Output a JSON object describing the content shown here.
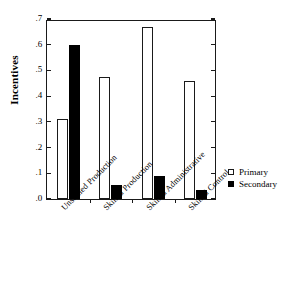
{
  "chart_data": {
    "type": "bar",
    "title": "",
    "xlabel": "",
    "ylabel": "Incentives",
    "ylim": [
      0.0,
      0.7
    ],
    "ytick_labels": [
      ".0",
      ".1",
      ".2",
      ".3",
      ".4",
      ".5",
      ".6",
      ".7"
    ],
    "ytick_values": [
      0.0,
      0.1,
      0.2,
      0.3,
      0.4,
      0.5,
      0.6,
      0.7
    ],
    "grid": false,
    "legend_position": "right",
    "categories": [
      "Unskilled Production",
      "Skilled Production",
      "Skilled Administrative",
      "Skilled Control"
    ],
    "series": [
      {
        "name": "Primary",
        "color": "#ffffff",
        "edge_color": "#1a1a1a",
        "values": [
          0.31,
          0.475,
          0.67,
          0.46
        ]
      },
      {
        "name": "Secondary",
        "color": "#000000",
        "edge_color": "#000000",
        "values": [
          0.6,
          0.055,
          0.09,
          0.035
        ]
      }
    ]
  },
  "legend": {
    "items": [
      {
        "label": "Primary",
        "swatch": "open-square-icon"
      },
      {
        "label": "Secondary",
        "swatch": "filled-square-icon"
      }
    ]
  }
}
